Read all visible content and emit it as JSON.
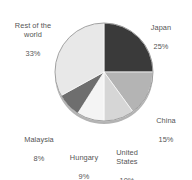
{
  "chart_data": {
    "type": "pie",
    "title": "",
    "subtitle": "",
    "xlabel": "",
    "ylabel": "",
    "legend_position": "none",
    "grid": false,
    "labels_show_percent": true,
    "start_angle_deg": 0,
    "direction": "clockwise",
    "categories": [
      "Japan",
      "China",
      "United States",
      "Hungary",
      "Malaysia",
      "Rest of the world"
    ],
    "values": [
      25,
      15,
      10,
      9,
      8,
      33
    ],
    "units": "%",
    "slices": [
      {
        "name": "Japan",
        "value": 25,
        "value_text": "25%",
        "color": "#3a3a3a",
        "label_lines": [
          "Japan",
          "25%"
        ]
      },
      {
        "name": "China",
        "value": 15,
        "value_text": "15%",
        "color": "#b4b4b4",
        "label_lines": [
          "China",
          "15%"
        ]
      },
      {
        "name": "United States",
        "value": 10,
        "value_text": "10%",
        "color": "#d6d6d6",
        "label_lines": [
          "United",
          "States",
          "10%"
        ]
      },
      {
        "name": "Hungary",
        "value": 9,
        "value_text": "9%",
        "color": "#f4f4f4",
        "label_lines": [
          "Hungary",
          "9%"
        ]
      },
      {
        "name": "Malaysia",
        "value": 8,
        "value_text": "8%",
        "color": "#6e6e6e",
        "label_lines": [
          "Malaysia",
          "8%"
        ]
      },
      {
        "name": "Rest of the world",
        "value": 33,
        "value_text": "33%",
        "color": "#e8e8e8",
        "label_lines": [
          "Rest of the",
          "world",
          "33%"
        ]
      }
    ]
  },
  "labels": {
    "japan": {
      "name": "Japan",
      "value": "25%"
    },
    "china": {
      "name": "China",
      "value": "15%"
    },
    "united_states": {
      "name": "United\nStates",
      "value": "10%"
    },
    "hungary": {
      "name": "Hungary",
      "value": "9%"
    },
    "malaysia": {
      "name": "Malaysia",
      "value": "8%"
    },
    "rest_of_the_world": {
      "name": "Rest of the\nworld",
      "value": "33%"
    }
  },
  "colors": {
    "japan": "#3a3a3a",
    "china": "#b4b4b4",
    "united_states": "#d6d6d6",
    "hungary": "#f4f4f4",
    "malaysia": "#6e6e6e",
    "rest_of_the_world": "#e8e8e8",
    "outline": "#8a8a8a",
    "shadow_rim": "#9a9a9a",
    "background": "#ffffff",
    "label_text": "#555555"
  }
}
